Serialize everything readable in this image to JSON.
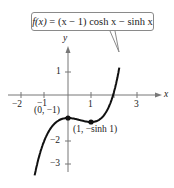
{
  "chart_data": {
    "type": "line",
    "title": "f(x) = (x − 1) cosh x − sinh x",
    "function": "(x - 1) * cosh(x) - sinh(x)",
    "xlabel": "x",
    "ylabel": "y",
    "xlim": [
      -2.9,
      4.0
    ],
    "ylim": [
      -3.5,
      2.2
    ],
    "x_ticks": [
      -2,
      -1,
      1,
      3
    ],
    "y_ticks": [
      1,
      -2,
      -3
    ],
    "grid": false,
    "series": [
      {
        "name": "f(x) = (x − 1) cosh x − sinh x",
        "x": [
          -1.45,
          -1.25,
          -1.0,
          -0.75,
          -0.5,
          -0.25,
          0.0,
          0.25,
          0.5,
          0.75,
          1.0,
          1.25,
          1.5,
          1.75,
          2.0,
          2.25
        ],
        "values": [
          -3.5,
          -2.78,
          -2.27,
          -1.77,
          -1.4,
          -1.16,
          -1.0,
          -1.03,
          -1.09,
          -1.14,
          -1.18,
          -1.12,
          -0.96,
          -0.45,
          0.14,
          1.52
        ]
      }
    ],
    "annotations": [
      {
        "label": "(0, −1)",
        "x": 0,
        "y": -1
      },
      {
        "label": "(1, −sinh 1)",
        "x": 1,
        "y": -1.1752
      }
    ]
  },
  "labels": {
    "callout_fx": "f(x)",
    "callout_rest": " = (x − 1) cosh x − sinh x",
    "x_axis": "x",
    "y_axis": "y",
    "tick_x_neg2": "−2",
    "tick_x_neg1": "−1",
    "tick_x_1": "1",
    "tick_x_3": "3",
    "tick_y_1": "1",
    "tick_y_neg2": "−2",
    "tick_y_neg3": "−3",
    "point_a": "(0, −1)",
    "point_b": "(1, −sinh 1)"
  },
  "colors": {
    "curve": "#111111",
    "axes": "#777777",
    "callout_border": "#8a8a8a",
    "text": "#222222"
  }
}
